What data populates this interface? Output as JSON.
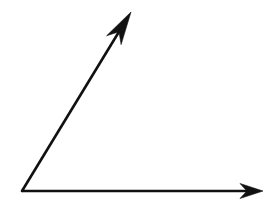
{
  "figure": {
    "name": "angle-diagram",
    "width": 275,
    "height": 217,
    "background_color": "#FFFFFF",
    "stroke_color": "#111111",
    "stroke_width": 2.6
  },
  "chart_data": {
    "type": "diagram",
    "title": "",
    "subtitle": "",
    "xlabel": "",
    "ylabel": "",
    "grid": false,
    "legend": false,
    "axis_ranges": {
      "x": [
        0,
        275
      ],
      "y": [
        0,
        217
      ]
    },
    "vertex": {
      "label": "",
      "x": 22,
      "y": 191
    },
    "rays": [
      {
        "name": "horizontal-ray",
        "from": [
          22,
          191
        ],
        "to": [
          263,
          191
        ],
        "angle_degrees": 0,
        "length_px": 241,
        "arrowhead": true,
        "arrowhead_tip": [
          263,
          191
        ],
        "arrowhead_length": 23,
        "arrowhead_half_width": 7.5
      },
      {
        "name": "diagonal-ray",
        "from": [
          22,
          191
        ],
        "to": [
          131,
          12
        ],
        "angle_degrees": 58.6,
        "length_px": 210,
        "arrowhead": true,
        "arrowhead_tip": [
          131,
          12
        ],
        "arrowhead_length": 33,
        "arrowhead_half_width": 8.5
      }
    ],
    "included_angle_degrees": 58.6,
    "angle_arc_shown": false,
    "annotations": []
  }
}
